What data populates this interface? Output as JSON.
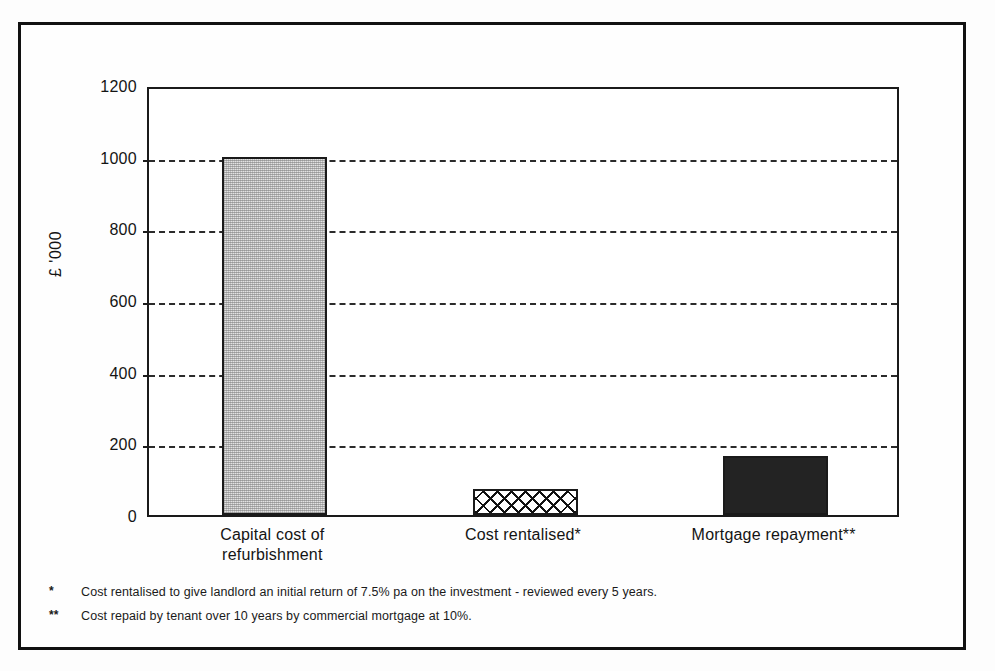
{
  "chart_data": {
    "type": "bar",
    "title": "",
    "xlabel": "",
    "ylabel": "£ '000",
    "ylim": [
      0,
      1200
    ],
    "ytick_values": [
      0,
      200,
      400,
      600,
      800,
      1000,
      1200
    ],
    "ytick_labels": [
      "0",
      "200",
      "400",
      "600",
      "800",
      "1000",
      "1200"
    ],
    "grid": true,
    "grid_style": "dashed horizontal",
    "legend": "none",
    "categories": [
      "Capital cost of refurbishment",
      "Cost rentalised*",
      "Mortgage repayment**"
    ],
    "category_lines": [
      [
        "Capital cost of",
        "refurbishment"
      ],
      [
        "Cost rentalised*"
      ],
      [
        "Mortgage repayment**"
      ]
    ],
    "values": [
      1000,
      73,
      165
    ],
    "bar_fills": [
      "light-grey-dither",
      "black-crosshatch",
      "solid-dark"
    ],
    "bar_colors": [
      "#e2e2e2",
      "#ffffff",
      "#232323"
    ],
    "bar_outline_color": "#1a1a1a",
    "annotations": []
  },
  "footnotes": [
    {
      "marker": "*",
      "text": "Cost rentalised to give landlord an initial return of 7.5% pa on the investment - reviewed every 5 years."
    },
    {
      "marker": "**",
      "text": "Cost repaid by tenant over 10 years by commercial mortgage at 10%."
    }
  ],
  "colors": {
    "border": "#111111",
    "axis": "#1a1a1a",
    "grid": "#2b2b2b",
    "text": "#141414",
    "background": "#fefefe"
  }
}
